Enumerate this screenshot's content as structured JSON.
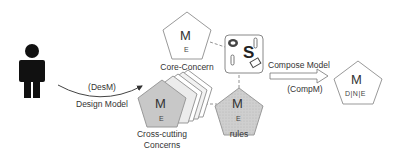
{
  "actor": {
    "icon": "person-icon",
    "color": "#111111"
  },
  "design_arrow": {
    "top_label": "(DesM)",
    "bottom_label": "Design Model"
  },
  "core_concern": {
    "big": "M",
    "small": "E",
    "label": "Core-Concern"
  },
  "cross_cutting": {
    "big": "M",
    "small": "E",
    "label_line1": "Cross-cutting",
    "label_line2": "Concerns",
    "fill": "#c8c8c8"
  },
  "rules": {
    "big": "M",
    "small": "E",
    "label": "rules"
  },
  "service_box": {
    "letter": "S"
  },
  "compose_arrow": {
    "top_label": "Compose Model",
    "bottom_label": "(CompM)"
  },
  "composed_model": {
    "big": "M",
    "small": "D|N|E"
  }
}
